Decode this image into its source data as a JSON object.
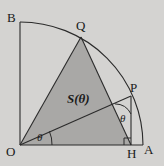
{
  "figure": {
    "kind": "geometry-diagram",
    "background_color": "#d4d3d1",
    "shade_color": "#a9a8a6",
    "stroke_color": "#2b2b2b",
    "labels": {
      "vertex_b": "B",
      "vertex_q": "Q",
      "vertex_p": "P",
      "vertex_o": "O",
      "vertex_h": "H",
      "vertex_a": "A",
      "angle_at_o": "θ",
      "angle_at_p": "θ",
      "area": "S(θ)"
    },
    "points": {
      "O": [
        20,
        145
      ],
      "B": [
        20,
        22
      ],
      "A": [
        143,
        145
      ],
      "Q": [
        81,
        37
      ],
      "P": [
        131,
        96
      ],
      "H": [
        131,
        145
      ]
    },
    "radius": 123,
    "angles_deg": {
      "Q_from_horizontal": 63,
      "P_from_horizontal": 23.5
    },
    "segments": [
      "O-B",
      "O-A",
      "O-Q",
      "Q-H",
      "O-P",
      "P-H",
      "arc B-A"
    ],
    "shaded_polygon": [
      "O",
      "Q",
      "H"
    ],
    "right_angle_marker_at": "H"
  }
}
